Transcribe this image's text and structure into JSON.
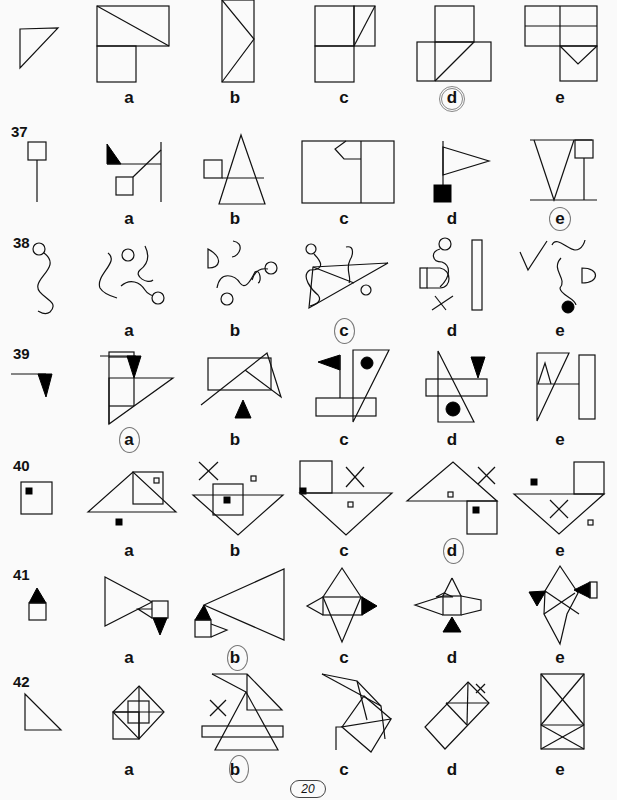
{
  "page_number": "20",
  "option_labels": [
    "a",
    "b",
    "c",
    "d",
    "e"
  ],
  "questions": [
    {
      "number": "",
      "circled_answer": "d"
    },
    {
      "number": "37",
      "circled_answer": "e"
    },
    {
      "number": "38",
      "circled_answer": "c"
    },
    {
      "number": "39",
      "circled_answer": "a"
    },
    {
      "number": "40",
      "circled_answer": "d"
    },
    {
      "number": "41",
      "circled_answer": "b"
    },
    {
      "number": "42",
      "circled_answer": "b"
    }
  ],
  "colors": {
    "ink": "#111111",
    "paper": "#fafafa",
    "circle": "#888888"
  }
}
